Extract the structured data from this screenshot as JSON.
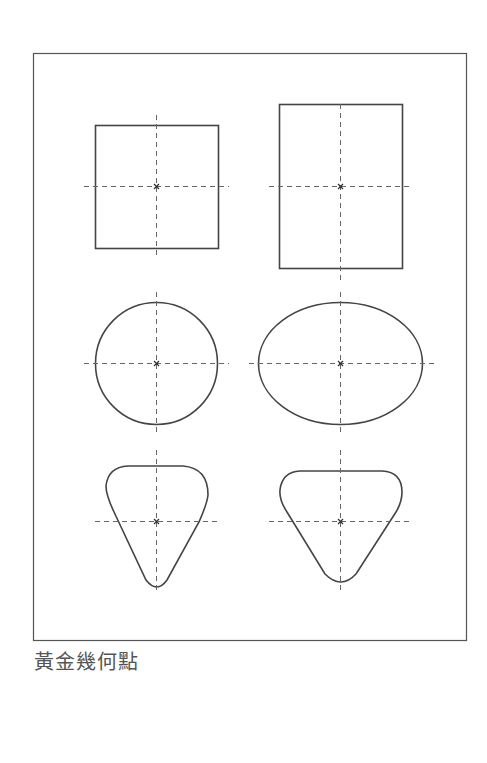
{
  "caption": "黃金幾何點",
  "colors": {
    "stroke": "#444444",
    "guide": "#666666",
    "caption": "#555555",
    "background": "#ffffff"
  },
  "frame": {
    "x": 33,
    "y": 53,
    "width": 433,
    "height": 587
  },
  "shapes": [
    {
      "id": "square",
      "type": "rect",
      "x": 95,
      "y": 125,
      "width": 123,
      "height": 123,
      "center": [
        156,
        186
      ]
    },
    {
      "id": "rectangle",
      "type": "rect",
      "x": 279,
      "y": 104,
      "width": 123,
      "height": 164,
      "center": [
        340,
        186
      ]
    },
    {
      "id": "circle",
      "type": "ellipse",
      "cx": 156,
      "cy": 363,
      "rx": 61,
      "ry": 61,
      "center": [
        156,
        363
      ]
    },
    {
      "id": "ellipse",
      "type": "ellipse",
      "cx": 340,
      "cy": 363,
      "rx": 82,
      "ry": 61,
      "center": [
        340,
        363
      ]
    },
    {
      "id": "rounded-triangle-narrow",
      "type": "rounded-triangle",
      "center": [
        156,
        521
      ]
    },
    {
      "id": "rounded-triangle-wide",
      "type": "rounded-triangle",
      "center": [
        340,
        521
      ]
    }
  ]
}
